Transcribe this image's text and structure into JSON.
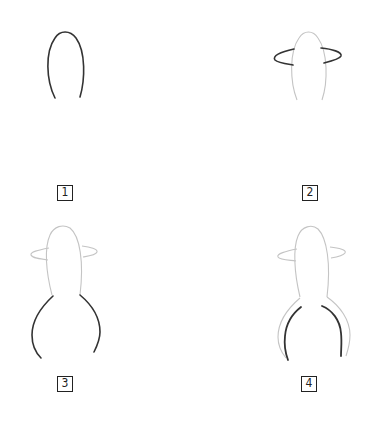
{
  "diagram": {
    "title": "",
    "steps": [
      {
        "number": "1",
        "element": "head-oval"
      },
      {
        "number": "2",
        "element": "hat-brim"
      },
      {
        "number": "3",
        "element": "body-outline"
      },
      {
        "number": "4",
        "element": "inner-leg-lines"
      }
    ],
    "colors": {
      "active_stroke": "#333333",
      "previous_stroke": "#bbbbbb",
      "label_border": "#222222"
    }
  }
}
